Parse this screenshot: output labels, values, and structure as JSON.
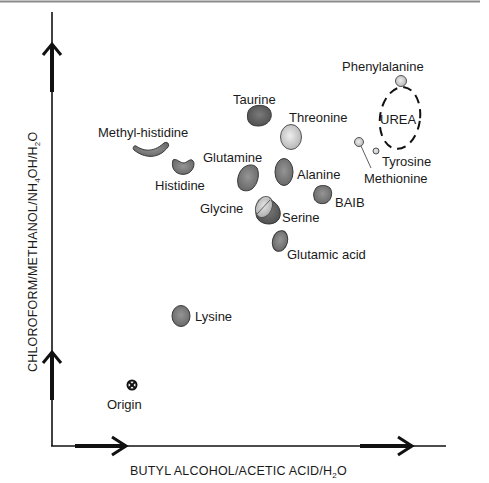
{
  "figure": {
    "type": "two-dimensional chromatography map",
    "colors": {
      "background": "#ffffff",
      "axis": "#111111",
      "top_rule": "#8a8a8a",
      "spot_dark": "#5e5e5e",
      "spot_mid": "#7d7d7d",
      "spot_light": "#c9c9c9",
      "spot_stroke": "#3a3a3a",
      "text": "#1a1a1a"
    },
    "x_axis": {
      "label_main": "BUTYL ALCOHOL/ACETIC ACID/H",
      "label_sub": "2",
      "label_end": "O"
    },
    "y_axis": {
      "label_part1": "CHLOROFORM/METHANOL/NH",
      "label_sub1": "4",
      "label_part2": "OH/H",
      "label_sub2": "2",
      "label_part3": "O"
    },
    "origin": {
      "label": "Origin",
      "icon": "circled-x-icon"
    },
    "spots": [
      {
        "name": "Phenylalanine",
        "shape": "circle",
        "shade": "light"
      },
      {
        "name": "UREA",
        "shape": "dashed-ellipse",
        "shade": "none"
      },
      {
        "name": "Taurine",
        "shape": "blob",
        "shade": "dark"
      },
      {
        "name": "Threonine",
        "shape": "oval",
        "shade": "light"
      },
      {
        "name": "Methyl-histidine",
        "shape": "crescent",
        "shade": "mid"
      },
      {
        "name": "Histidine",
        "shape": "kidney",
        "shade": "mid"
      },
      {
        "name": "Glutamine",
        "shape": "blob",
        "shade": "mid"
      },
      {
        "name": "Alanine",
        "shape": "oval",
        "shade": "mid"
      },
      {
        "name": "Tyrosine",
        "shape": "small-circle",
        "shade": "light"
      },
      {
        "name": "Methionine",
        "shape": "small-circle",
        "shade": "light"
      },
      {
        "name": "BAIB",
        "shape": "blob",
        "shade": "mid"
      },
      {
        "name": "Glycine",
        "shape": "oval",
        "shade": "light"
      },
      {
        "name": "Serine",
        "shape": "oval",
        "shade": "dark"
      },
      {
        "name": "Glutamic acid",
        "shape": "oval",
        "shade": "mid"
      },
      {
        "name": "Lysine",
        "shape": "oval",
        "shade": "mid"
      }
    ]
  }
}
